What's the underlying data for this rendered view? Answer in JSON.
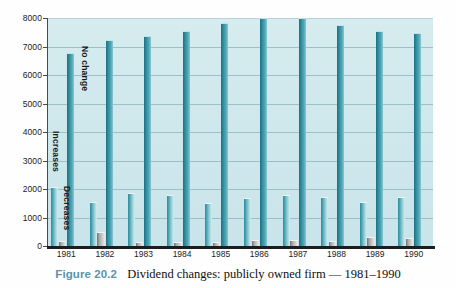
{
  "figure": {
    "number_label": "Figure 20.2",
    "caption": "Dividend changes: publicly owned firm — 1981–1990"
  },
  "series_labels": {
    "increases": "Increases",
    "decreases": "Decreases",
    "no_change": "No change"
  },
  "colors": {
    "plot_background": "#cfe8ec",
    "increases_bar": "#46a3b2",
    "decreases_bar": "#a9abab",
    "no_change_bar": "#2f8c9d",
    "gridline": "#9fbfc6",
    "axis": "#1d1d1d",
    "caption_number": "#5a93a8"
  },
  "chart_data": {
    "type": "bar",
    "title": "Dividend changes: publicly owned firm — 1981–1990",
    "xlabel": "",
    "ylabel": "",
    "ylim": [
      0,
      8000
    ],
    "yticks": [
      0,
      1000,
      2000,
      3000,
      4000,
      5000,
      6000,
      7000,
      8000
    ],
    "ytick_labels": [
      "0",
      "1000",
      "2000",
      "3000",
      "4000",
      "5000",
      "6000",
      "7000",
      "8000"
    ],
    "grid": true,
    "legend": "in-plot vertical text labels on first group",
    "categories": [
      "1981",
      "1982",
      "1983",
      "1984",
      "1985",
      "1986",
      "1987",
      "1988",
      "1989",
      "1990"
    ],
    "series": [
      {
        "name": "Increases",
        "color": "#46a3b2",
        "values": [
          2050,
          1500,
          1820,
          1750,
          1480,
          1650,
          1750,
          1680,
          1500,
          1700
        ]
      },
      {
        "name": "Decreases",
        "color": "#a9abab",
        "values": [
          130,
          440,
          110,
          100,
          90,
          190,
          160,
          150,
          280,
          230
        ]
      },
      {
        "name": "No change",
        "color": "#2f8c9d",
        "values": [
          6750,
          7180,
          7320,
          7500,
          7780,
          7980,
          7980,
          7720,
          7500,
          7450
        ]
      }
    ]
  }
}
